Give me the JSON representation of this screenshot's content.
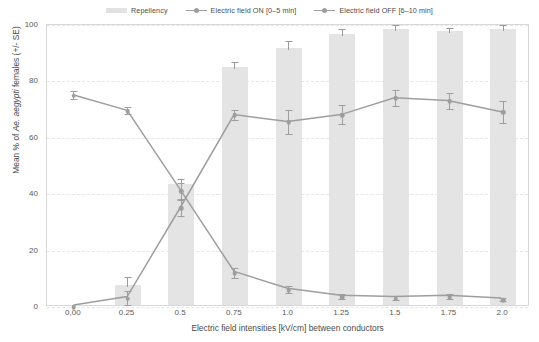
{
  "chart_data": {
    "type": "bar",
    "title": "",
    "xlabel": "Electric field intensities [kV/cm] between conductors",
    "ylabel": "Mean % of Ae. aegypti females (+/- SE)",
    "ylabel_plain": "Mean % of ",
    "ylabel_italic": "Ae. aegypti",
    "ylabel_tail": " females (+/- SE)",
    "categories": [
      "0,00",
      "0.25",
      "0.5",
      "0.75",
      "1.0",
      "1.25",
      "1.5",
      "1.75",
      "2.0"
    ],
    "ylim": [
      0,
      100
    ],
    "yticks": [
      0,
      20,
      40,
      60,
      80,
      100
    ],
    "grid": true,
    "legend_position": "top-center",
    "series": [
      {
        "name": "Repellency",
        "kind": "bar",
        "color": "#e4e4e4",
        "values": [
          0,
          7,
          43,
          84.5,
          91,
          96,
          98,
          97,
          98
        ],
        "errors": [
          0,
          3.5,
          2.5,
          2.5,
          3.5,
          2.5,
          2,
          2,
          2
        ]
      },
      {
        "name": "Electric field ON [0–5 min]",
        "kind": "line",
        "color": "#9e9e9e",
        "values": [
          0,
          3,
          35,
          68,
          65.5,
          68,
          74,
          73,
          69
        ],
        "errors": [
          0,
          2.5,
          3,
          2,
          4.5,
          3.5,
          3,
          3,
          4
        ]
      },
      {
        "name": "Electric field OFF [6–10 min]",
        "kind": "line",
        "color": "#9e9e9e",
        "values": [
          75,
          69.5,
          41,
          12,
          6,
          3.5,
          3,
          3.5,
          2.5
        ],
        "errors": [
          1.5,
          1.5,
          3,
          2,
          1.5,
          1,
          1,
          1,
          0.8
        ]
      }
    ]
  },
  "legend": {
    "items": [
      {
        "label": "Repellency",
        "marker": "bar-swatch-icon",
        "color": "#e4e4e4"
      },
      {
        "label": "Electric field ON [0–5 min]",
        "marker": "line-marker-icon",
        "color": "#9e9e9e"
      },
      {
        "label": "Electric field OFF [6–10 min]",
        "marker": "line-marker-icon",
        "color": "#9e9e9e"
      }
    ]
  },
  "colors": {
    "bar": "#e4e4e4",
    "line_on": "#9e9e9e",
    "line_off": "#9e9e9e",
    "grid": "#e6e6e6",
    "frame": "#d8d8d8",
    "text": "#4b4b4b",
    "background": "#ffffff"
  }
}
